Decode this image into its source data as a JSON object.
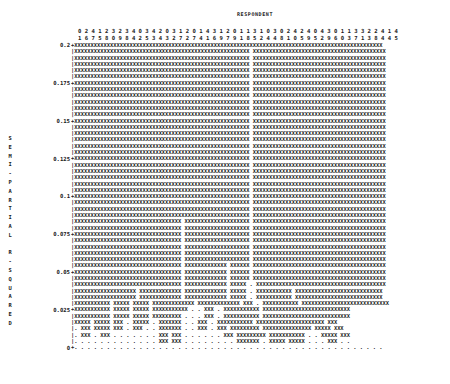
{
  "chart_data": {
    "type": "dendrogram",
    "title": "RESPONDENT",
    "xlabel": "RESPONDENT",
    "ylabel": "SEMI-PARTIAL R-SQUARED",
    "ylim": [
      0,
      0.2
    ],
    "yticks": [
      "0.2",
      "0.175",
      "0.15",
      "0.125",
      "0.1",
      "0.075",
      "0.05",
      "0.025",
      "0"
    ],
    "respondent_ids_row1": "0 2 4 1 2 3 2 3 4 0 3 4 2 0 3 1 2 0 1 4 3 1 2 0 1 1 3 1 0 3 0 2 4 2 4 0 4 3 0 1 1 3 3 2 2 4 1 4",
    "respondent_ids_row2": "1 6 7 5 8 0 9 8 4 2 5 3 4 3 2 7 2 7 4 1 6 9 7 9 1 8 5 2 4 4 8 1 0 5 9 5 2 9 6 0 3 7 1 3 8 4 4 5",
    "respondents": [
      "01",
      "26",
      "47",
      "15",
      "28",
      "30",
      "29",
      "38",
      "44",
      "02",
      "35",
      "43",
      "24",
      "03",
      "32",
      "17",
      "22",
      "07",
      "14",
      "41",
      "36",
      "19",
      "27",
      "09",
      "11",
      "18",
      "35",
      "12",
      "04",
      "34",
      "08",
      "21",
      "40",
      "25",
      "49",
      "05",
      "42",
      "39",
      "06",
      "10",
      "13",
      "37",
      "31",
      "23",
      "28",
      "44",
      "14",
      "45"
    ],
    "grid_legend": {
      "X": "joined cluster",
      ".": "unjoined respondent",
      "+": "tick mark",
      "|": "axis"
    },
    "rows": [
      {
        "y": "0.2",
        "tick": true,
        "pattern": "XXXXXXXXXXXXXXXXXXXXXXXXXXXXXXXXXXXXXXXXXXXXXXXXXXXXXXXXXXXXXXXXXXXXXXXXXXXXXXXXXXXXXXXXXXXXXXX"
      },
      {
        "y": "",
        "tick": false,
        "pattern": "XXXXXXXXXXXXXXXXXXXXXXXXXXXXXXXXXXXXXXXXXXXXXXXXXXXXXX XXXXXXXXXXXXXXXXXXXXXXXXXXXXXXXXXXXXXXXXX"
      },
      {
        "y": "",
        "tick": false,
        "pattern": "XXXXXXXXXXXXXXXXXXXXXXXXXXXXXXXXXXXXXXXXXXXXXXXXXXXXXX XXXXXXXXXXXXXXXXXXXXXXXXXXXXXXXXXXXXXXXXX"
      },
      {
        "y": "",
        "tick": false,
        "pattern": "XXXXXXXXXXXXXXXXXXXXXXXXXXXXXXXXXXXXXXXXXXXXXXXXXXXXXX XXXXXXXXXXXXXXXXXXXXXXXXXXXXXXXXXXXXXXXXX"
      },
      {
        "y": "",
        "tick": false,
        "pattern": "XXXXXXXXXXXXXXXXXXXXXXXXXXXXXXXXXXXXXXXXXXXXXXXXXXXXXX XXXXXXXXXXXXXXXXXXXXXXXXXXXXXXXXXXXXXXXXX"
      },
      {
        "y": "",
        "tick": false,
        "pattern": "XXXXXXXXXXXXXXXXXXXXXXXXXXXXXXXXXXXXXXXXXXXXXXXXXXXXXX XXXXXXXXXXXXXXXXXXXXXXXXXXXXXXXXXXXXXXXXX"
      },
      {
        "y": "0.175",
        "tick": true,
        "pattern": "XXXXXXXXXXXXXXXXXXXXXXXXXXXXXXXXXXXXXXXXXXXXXXXXXXXXXX XXXXXXXXXXXXXXXXXXXXXXXXXXXXXXXXXXXXXXXXX"
      },
      {
        "y": "",
        "tick": false,
        "pattern": "XXXXXXXXXXXXXXXXXXXXXXXXXXXXXXXXXXXXXXXXXXXXXXXXXXXXXX XXXXXXXXXXXXXXXXXXXXXXXXXXXXXXXXXXXXXXXXX"
      },
      {
        "y": "",
        "tick": false,
        "pattern": "XXXXXXXXXXXXXXXXXXXXXXXXXXXXXXXXXXXXXXXXXXXXXXXXXXXXXX XXXXXXXXXXXXXXXXXXXXXXXXXXXXXXXXXXXXXXXXX"
      },
      {
        "y": "",
        "tick": false,
        "pattern": "XXXXXXXXXXXXXXXXXXXXXXXXXXXXXXXXXXXXXXXXXXXXXXXXXXXXXX XXXXXXXXXXXXXXXXXXXXXXXXXXXXXXXXXXXXXXXXX"
      },
      {
        "y": "",
        "tick": false,
        "pattern": "XXXXXXXXXXXXXXXXXXXXXXXXXXXXXXXXXXXXXXXXXXXXXXXXXXXXXX XXXXXXXXXXXXXXXXXXXXXXXXXXXXXXXXXXXXXXXXX"
      },
      {
        "y": "",
        "tick": false,
        "pattern": "XXXXXXXXXXXXXXXXXXXXXXXXXXXXXXXXXXXXXXXXXXXXXXXXXXXXXX XXXXXXXXXXXXXXXXXXXXXXXXXXXXXXXXXXXXXXXXX"
      },
      {
        "y": "0.15",
        "tick": true,
        "pattern": "XXXXXXXXXXXXXXXXXXXXXXXXXXXXXXXXXXXXXXXXXXXXXXXXXXXXXX XXXXXXXXXXXXXXXXXXXXXXXXXXXXXXXXXXXXXXXXX"
      },
      {
        "y": "",
        "tick": false,
        "pattern": "XXXXXXXXXXXXXXXXXXXXXXXXXXXXXXXXXXXXXXXXXXXXXXXXXXXXXX XXXXXXXXXXXXXXXXXXXXXXXXXXXXXXXXXXXXXXXXX"
      },
      {
        "y": "",
        "tick": false,
        "pattern": "XXXXXXXXXXXXXXXXXXXXXXXXXXXXXXXXXXXXXXXXXXXXXXXXXXXXXX XXXXXXXXXXXXXXXXXXXXXXXXXXXXXXXXXXXXXXXXX"
      },
      {
        "y": "",
        "tick": false,
        "pattern": "XXXXXXXXXXXXXXXXXXXXXXXXXXXXXXXXXXXXXXXXXXXXXXXXXXXXXX XXXXXXXXXXXXXXXXXXXXXXXXXXXXXXXXXXXXXXXXX"
      },
      {
        "y": "",
        "tick": false,
        "pattern": "XXXXXXXXXXXXXXXXXXXXXXXXXXXXXXXXXXXXXXXXXXXXXXXXXXXXXX XXXXXXXXXXXXXXXXXXXXXXXXXXXXXXXXXXXXXXXXX"
      },
      {
        "y": "",
        "tick": false,
        "pattern": "XXXXXXXXXXXXXXXXXXXXXXXXXXXXXXXXXXXXXXXXXXXXXXXXXXXXXX XXXXXXXXXXXXXXXXXXXXXXXXXXXXXXXXXXXXXXXXX"
      },
      {
        "y": "0.125",
        "tick": true,
        "pattern": "XXXXXXXXXXXXXXXXXXXXXXXXXXXXXXXXXXXXXXXXXXXXXXXXXXXXXX XXXXXXXXXXXXXXXXXXXXXXXXXXXXXXXXXXXXXXXXX"
      },
      {
        "y": "",
        "tick": false,
        "pattern": "XXXXXXXXXXXXXXXXXXXXXXXXXXXXXXXXXXXXXXXXXXXXXXXXXXXXXX XXXXXXXXXXXXXXXXXXXXXXXXXXXXXXXXXXXXXXXXX"
      },
      {
        "y": "",
        "tick": false,
        "pattern": "XXXXXXXXXXXXXXXXXXXXXXXXXXXXXXXXXXXXXXXXXXXXXXXXXXXXXX XXXXXXXXXXXXXXXXXXXXXXXXXXXXXXXXXXXXXXXXX"
      },
      {
        "y": "",
        "tick": false,
        "pattern": "XXXXXXXXXXXXXXXXXXXXXXXXXXXXXXXXXXXXXXXXXXXXXXXXXXXXXX XXXXXXXXXXXXXXXXXXXXXXXXXXXXXXXXXXXXXXXXX"
      },
      {
        "y": "",
        "tick": false,
        "pattern": "XXXXXXXXXXXXXXXXXXXXXXXXXXXXXXXXXXXXXXXXXXXXXXXXXXXXXX XXXXXXXXXXXXXXXXXXXXXXXXXXXXXXXXXXXXXXXXX"
      },
      {
        "y": "",
        "tick": false,
        "pattern": "XXXXXXXXXXXXXXXXXXXXXXXXXXXXXXXXXXXXXXXXXXXXXXXXXXXXXX XXXXXXXXXXXXXXXXXXXXXXXXXXXXXXXXXXXXXXXXX"
      },
      {
        "y": "0.1",
        "tick": true,
        "pattern": "XXXXXXXXXXXXXXXXXXXXXXXXXXXXXXXXXXXXXXXXXXXXXXXXXXXXXX XXXXXXXXXXXXXXXXXXXXXXXXXXXXXXXXXXXXXXXXX"
      },
      {
        "y": "",
        "tick": false,
        "pattern": "XXXXXXXXXXXXXXXXXXXXXXXXXXXXXXXXXXXXXXXXXXXXXXXXXXXXXX XXXXXXXXXXXXXXXXXXXXXXXXXXXXXXXXXXXXXXXXX"
      },
      {
        "y": "",
        "tick": false,
        "pattern": "XXXXXXXXXXXXXXXXXXXXXXXXXXXXXXXXXXXXXXXXXXXXXXXXXXXXXX XXXXXXXXXXXXXXXXXXXXXXXXXXXXXXXXXXXXXXXXX"
      },
      {
        "y": "",
        "tick": false,
        "pattern": "XXXXXXXXXXXXXXXXXXXXXXXXXXXXXXXXXXXXXXXXXXXXXXXXXXXXXX XXXXXXXXXXXXXXXXXXXXXXXXXXXXXXXXXXXXXXXXX"
      },
      {
        "y": "",
        "tick": false,
        "pattern": "XXXXXXXXXXXXXXXXXXXXXXXXXXXXXXXXX XXXXXXXXXXXXXXXXXXXX XXXXXXXXXXXXXXXXXXXXXXXXXXXXXXXXXXXXXXXXX"
      },
      {
        "y": "",
        "tick": false,
        "pattern": "XXXXXXXXXXXXXXXXXXXXXXXXXXXXXXXXX XXXXXXXXXXXXXXXXXXXX XXXXXXXXXXXXXXXXXXXXXXXXXXXXXXXXXXXXXXXXX"
      },
      {
        "y": "0.075",
        "tick": true,
        "pattern": "XXXXXXXXXXXXXXXXXXXXXXXXXXXXXXXXX XXXXXXXXXXXXXXXXXXXX XXXXXXXXXXXXXXXXXXXXXXXXXXXXXXXXXXXXXXXXX"
      },
      {
        "y": "",
        "tick": false,
        "pattern": "XXXXXXXXXXXXXXXXXXXXXXXXXXXXXXXXX XXXXXXXXXXXXXXXXXXXX XXXXXXXXXXXXXXXXXXXXXXXXXXXXXXXXXXXXXXXXX"
      },
      {
        "y": "",
        "tick": false,
        "pattern": "XXXXXXXXXXXXXXXXXXXXXXXXXXXXXXXXX XXXXXXXXXXXXXXXXXXXX XXXXXXXXXXXXXXXXXXXXXXXXXXXXXXXXXXXXXXXXX"
      },
      {
        "y": "",
        "tick": false,
        "pattern": "XXXXXXXXXXXXXXXXXXXXXXXXXXXXXXXXX XXXXXXXXXXXXXXXXXXXX XXXXXXXXXXXXXXXXXXXXXXXXXXXXXXXXXXXXXXXXX"
      },
      {
        "y": "",
        "tick": false,
        "pattern": "XXXXXXXXXXXXXXXXXXXXXXXXXXXXXXXXX XXXXXXXXXXXXXXXXXXXX XXXXXXXXXXXXXXXXXXXXXXXXXXXXXXXXXXXXXXXXX"
      },
      {
        "y": "",
        "tick": false,
        "pattern": "XXXXXXXXXXXXXXXXXXXXXXXXXXXXXXXXX XXXXXXXXXXXXX XXXXXX XXXXXXXXXXXXXXXXXXXXXXXXXXXXXXXXXXXXXXXXX"
      },
      {
        "y": "0.05",
        "tick": true,
        "pattern": "XXXXXXXXXXXXXXXXXXXXXXXXXXXXXXXXX XXXXXXXXXXXXX XXXXXX XXXXXXXXXXXXXXXXXXXXXXXXXXXXXXXXXXXXXXXXX"
      },
      {
        "y": "",
        "tick": false,
        "pattern": "XXXXXXXXXXXXXXXXXXXXXXXXXXXXXXXXX XXXXXXXXXXXXX XXXXXX XXXXXXXXXXXXXXXXXXXXXXXXXXXXXXXXXXXXXXXXX"
      },
      {
        "y": "",
        "tick": false,
        "pattern": "XXXXXXXXXXXXXXXXXXXXXXXXXXXXXXXXX XXXXXXXXXXXXX XXXXX . XXXXXXXXXXXXXXXXXXXXXXXXXXXXXXXXXXXXXXXX"
      },
      {
        "y": "",
        "tick": false,
        "pattern": "XXXXXXXXXXXXXXXXXXX XXXXXXXXXXXXX XXXXXXXXXXXXX XXXXX . XXXXXXXXXXX XXXXXXXXXXXXXXXXXXXXXXXXXXX"
      },
      {
        "y": "",
        "tick": false,
        "pattern": "XXXXXXXXXXXXXXXXXXX XXXXXXXXXXXXX XXXXXXXXXXXXX XXXXX . XXXXXXXXXXX XXXXXXXXXXXXXXXXXXXXXXXXXXX"
      },
      {
        "y": "",
        "tick": false,
        "pattern": "XXXXXXXXXXX XXXXX XXXXX XXXXXXXXXXXXX XXXXXXXXXXXXX XXX . XXXXXXXXXXX XXXXXXXXXXXXXXXXXXXXXXXXXXX"
      },
      {
        "y": "0.025",
        "tick": true,
        "pattern": "XXXXXXXXXXX XXXXX XXXXX XXXXXXXXXXX . . XXX . XXXXXXXXXXX XXXXXXXXXXXXXXXXXXXXXXXXXXX"
      },
      {
        "y": "",
        "tick": false,
        "pattern": "XXXXXXXXXXX XXXXX XXXXX XXXXXXXXX . . . XXX . XXXXXXXXXXX XXXXXXXXXXXXXXXXXXXXXXXXXXX"
      },
      {
        "y": "",
        "tick": false,
        "pattern": "XXXXX XXXXX XXX . XXXXX . XXXXXXX . . XXX . XXXXXXXXXXX XXXXXXXXXXXXXXXXXXXXX XXX"
      },
      {
        "y": "",
        "tick": false,
        "pattern": ". XXX XXXXX XXX . XXX . . XXXXXXX . . XXX . XXX XXXXXXXXX XXXXXXXXXXXXXXX XXXXX XXX"
      },
      {
        "y": "",
        "tick": false,
        "pattern": ". XXX . XXX . . . . . . . XXX XXX . . . . . . XXX XXXXXXXXX XXXXXXXXXXX . . XXXXX XXX"
      },
      {
        "y": "",
        "tick": false,
        "pattern": ". . . . . . . . . . . . . XXX XXX . . . . . . . . XXXXXXX . XXXXX XXXXX . . . XXX . ."
      },
      {
        "y": "0",
        "tick": true,
        "pattern": ". . . . . . . . . . . . . . . . . . . . . . . . . . . . . . . . . . . . . . . . . . . . . . . ."
      }
    ]
  }
}
